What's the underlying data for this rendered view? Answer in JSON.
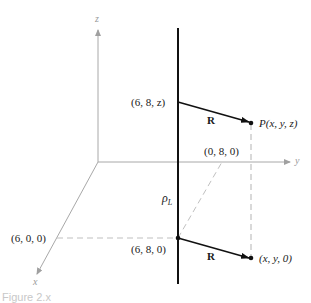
{
  "figure": {
    "axes": {
      "x_label": "x",
      "y_label": "y",
      "z_label": "z",
      "axis_color": "#a0a0a0"
    },
    "line_charge": {
      "label_rho": "ρ",
      "label_sub": "L",
      "color": "#111111"
    },
    "points": {
      "top_on_line": "(6, 8, z)",
      "P": "P(x, y, z)",
      "bottom_on_line": "(6, 8, 0)",
      "projection": "(x, y, 0)",
      "on_y_axis": "(0, 8, 0)",
      "on_x_axis": "(6, 0, 0)"
    },
    "vectors": {
      "upper_R": "R",
      "lower_R": "R"
    },
    "dashed_color": "#bdbdbd",
    "caption": "Figure 2.x"
  }
}
